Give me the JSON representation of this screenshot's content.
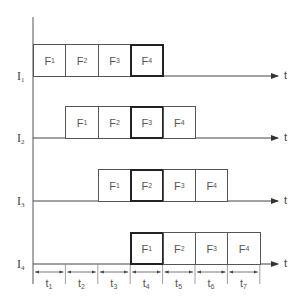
{
  "diagram": {
    "type": "instruction-pipeline-timing",
    "axis_label": "t",
    "rows": [
      {
        "label": "I",
        "sub": "1",
        "start_slot": 0,
        "stages": [
          {
            "label": "F",
            "sub": "1"
          },
          {
            "label": "F",
            "sub": "2"
          },
          {
            "label": "F",
            "sub": "3"
          },
          {
            "label": "F",
            "sub": "4",
            "highlight": true
          }
        ]
      },
      {
        "label": "I",
        "sub": "2",
        "start_slot": 1,
        "stages": [
          {
            "label": "F",
            "sub": "1"
          },
          {
            "label": "F",
            "sub": "2"
          },
          {
            "label": "F",
            "sub": "3",
            "highlight": true
          },
          {
            "label": "F",
            "sub": "4"
          }
        ]
      },
      {
        "label": "I",
        "sub": "3",
        "start_slot": 2,
        "stages": [
          {
            "label": "F",
            "sub": "1"
          },
          {
            "label": "F",
            "sub": "2",
            "highlight": true
          },
          {
            "label": "F",
            "sub": "3"
          },
          {
            "label": "F",
            "sub": "4"
          }
        ]
      },
      {
        "label": "I",
        "sub": "4",
        "start_slot": 3,
        "stages": [
          {
            "label": "F",
            "sub": "1",
            "highlight": true
          },
          {
            "label": "F",
            "sub": "2"
          },
          {
            "label": "F",
            "sub": "3"
          },
          {
            "label": "F",
            "sub": "4"
          }
        ]
      }
    ],
    "time_slots": [
      {
        "label": "t",
        "sub": "1"
      },
      {
        "label": "t",
        "sub": "2"
      },
      {
        "label": "t",
        "sub": "3"
      },
      {
        "label": "t",
        "sub": "4"
      },
      {
        "label": "t",
        "sub": "5"
      },
      {
        "label": "t",
        "sub": "6"
      },
      {
        "label": "t",
        "sub": "7"
      }
    ],
    "colors": {
      "line": "#444444",
      "highlight_border": "#222222",
      "background": "#ffffff"
    }
  }
}
